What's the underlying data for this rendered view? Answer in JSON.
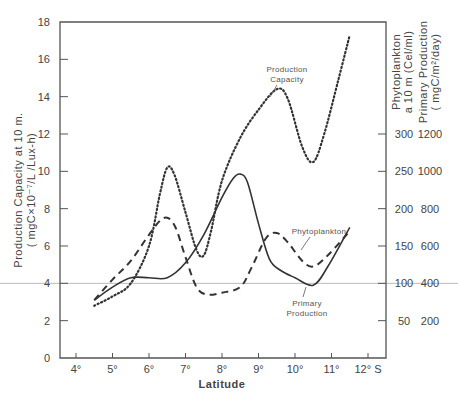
{
  "chart_data": {
    "type": "line",
    "title": "",
    "xlabel": "Latitude",
    "ylabel_left": [
      "Production Capacity at 10 m.",
      "( mgC×10⁻⁷/L /Lux-h)"
    ],
    "ylabel_right_1": [
      "Phytoplankton",
      "a 10 m (Cel/ml)"
    ],
    "ylabel_right_2": [
      "Primary Production",
      "( mgC/m²/day)"
    ],
    "x_ticks": [
      "4°",
      "5°",
      "6°",
      "7°",
      "8°",
      "9°",
      "10°",
      "11°",
      "12° S"
    ],
    "x_tick_values": [
      4,
      5,
      6,
      7,
      8,
      9,
      10,
      11,
      12
    ],
    "xlim": [
      3.55,
      12.5
    ],
    "y_left_ticks": [
      0,
      2,
      4,
      6,
      8,
      10,
      12,
      14,
      16,
      18
    ],
    "ylim_left": [
      0,
      18
    ],
    "y_right_ticks": [
      {
        "left_equiv": 2,
        "phyto": "50",
        "prod": "200"
      },
      {
        "left_equiv": 4,
        "phyto": "100",
        "prod": "400"
      },
      {
        "left_equiv": 6,
        "phyto": "150",
        "prod": "600"
      },
      {
        "left_equiv": 8,
        "phyto": "200",
        "prod": "800"
      },
      {
        "left_equiv": 10,
        "phyto": "250",
        "prod": "1000"
      },
      {
        "left_equiv": 12,
        "phyto": "300",
        "prod": "1200"
      }
    ],
    "reference_line": {
      "y_left": 4,
      "color": "#bbbbbb"
    },
    "series": [
      {
        "name": "Production Capacity",
        "axis": "left",
        "style": "dotted",
        "x": [
          4.5,
          5.0,
          5.5,
          6.0,
          6.3,
          6.5,
          6.7,
          7.0,
          7.3,
          7.5,
          7.7,
          8.0,
          8.5,
          9.0,
          9.5,
          9.8,
          10.2,
          10.5,
          10.8,
          11.2,
          11.5
        ],
        "y": [
          2.8,
          3.3,
          4.0,
          6.0,
          8.8,
          10.2,
          9.8,
          7.8,
          5.8,
          5.5,
          6.8,
          9.5,
          11.8,
          13.3,
          14.4,
          13.9,
          11.3,
          10.5,
          12.0,
          15.0,
          17.3
        ]
      },
      {
        "name": "Phytoplankton",
        "axis": "right (cells/ml, = left × 25)",
        "style": "dashed",
        "x": [
          4.5,
          5.0,
          5.5,
          6.0,
          6.4,
          6.7,
          7.0,
          7.3,
          7.6,
          8.0,
          8.5,
          8.8,
          9.2,
          9.5,
          9.8,
          10.2,
          10.5,
          10.9,
          11.5
        ],
        "y": [
          3.1,
          4.2,
          5.2,
          6.6,
          7.5,
          7.1,
          5.4,
          3.8,
          3.4,
          3.5,
          3.8,
          4.8,
          6.4,
          6.7,
          6.2,
          5.2,
          4.9,
          5.5,
          6.8
        ]
      },
      {
        "name": "Primary Production",
        "axis": "right (mgC/m²/day, = left × 100)",
        "style": "solid",
        "x": [
          4.5,
          5.0,
          5.5,
          6.0,
          6.5,
          7.0,
          7.5,
          8.0,
          8.3,
          8.5,
          8.7,
          9.0,
          9.3,
          9.6,
          10.0,
          10.5,
          10.9,
          11.5
        ],
        "y": [
          3.1,
          3.8,
          4.3,
          4.3,
          4.3,
          5.1,
          6.6,
          8.6,
          9.6,
          9.85,
          9.4,
          7.2,
          5.3,
          4.7,
          4.3,
          3.9,
          4.9,
          7.0
        ]
      }
    ],
    "annotations": [
      {
        "text": [
          "Production",
          "Capacity"
        ],
        "target": "Production Capacity"
      },
      {
        "text": [
          "Phytoplankton"
        ],
        "target": "Phytoplankton"
      },
      {
        "text": [
          "Primary",
          "Production"
        ],
        "target": "Primary Production"
      }
    ],
    "grid": false,
    "legend": "none (inline labels)"
  }
}
